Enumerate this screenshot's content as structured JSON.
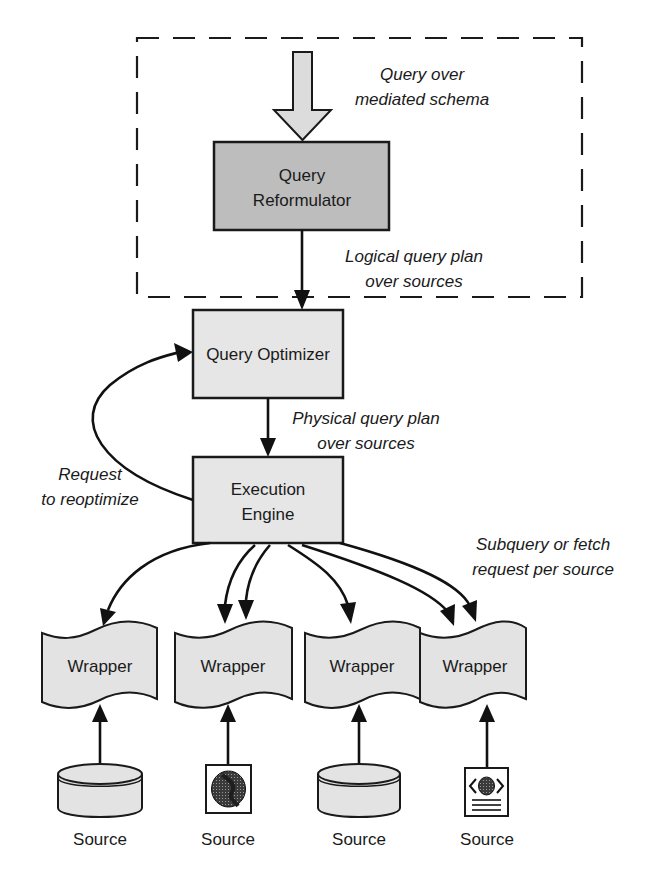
{
  "diagram": {
    "container": {
      "label": "",
      "style": "dashed"
    },
    "nodes": {
      "reformulator": {
        "line1": "Query",
        "line2": "Reformulator"
      },
      "optimizer": {
        "label": "Query Optimizer"
      },
      "engine": {
        "line1": "Execution",
        "line2": "Engine"
      },
      "wrappers": [
        {
          "label": "Wrapper"
        },
        {
          "label": "Wrapper"
        },
        {
          "label": "Wrapper"
        },
        {
          "label": "Wrapper"
        }
      ],
      "sources": [
        {
          "label": "Source",
          "icon": "database-cylinder-icon"
        },
        {
          "label": "Source",
          "icon": "globe-icon"
        },
        {
          "label": "Source",
          "icon": "database-cylinder-icon"
        },
        {
          "label": "Source",
          "icon": "web-document-icon"
        }
      ]
    },
    "edge_labels": {
      "input": {
        "line1": "Query over",
        "line2": "mediated schema"
      },
      "logical": {
        "line1": "Logical query plan",
        "line2": "over sources"
      },
      "physical": {
        "line1": "Physical query plan",
        "line2": "over sources"
      },
      "reoptimize": {
        "line1": "Request",
        "line2": "to reoptimize"
      },
      "subquery": {
        "line1": "Subquery or fetch",
        "line2": "request per source"
      }
    }
  }
}
